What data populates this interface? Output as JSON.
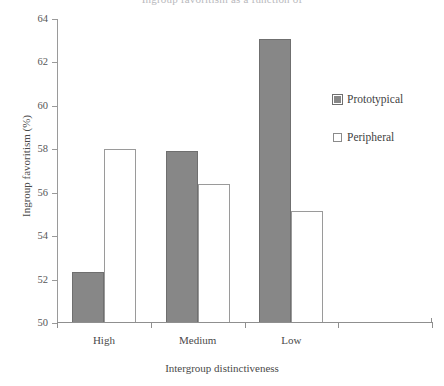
{
  "chart_data": {
    "type": "bar",
    "title": "Ingroup favoritism as a function of",
    "xlabel": "Intergroup distinctiveness",
    "ylabel": "Ingroup favoritism (%)",
    "categories": [
      "High",
      "Medium",
      "Low",
      ""
    ],
    "ylim": [
      50,
      64
    ],
    "ytick_step": 2,
    "yticks": [
      50,
      52,
      54,
      56,
      58,
      60,
      62,
      64
    ],
    "ytick_labels": [
      "50",
      "52",
      "54",
      "56",
      "58",
      "60",
      "62",
      "64"
    ],
    "grid": false,
    "legend_position": "right",
    "series": [
      {
        "name": "Prototypical",
        "color": "#878787",
        "values": [
          52.35,
          57.9,
          63.1,
          null
        ]
      },
      {
        "name": "Peripheral",
        "color": "#ffffff",
        "values": [
          58.0,
          56.4,
          55.15,
          null
        ]
      }
    ]
  },
  "axes": {
    "y_label": "Ingroup favoritism (%)",
    "x_label": "Intergroup distinctiveness"
  },
  "legend": {
    "items": [
      {
        "label": "Prototypical",
        "swatch": "filled-gray-square-icon"
      },
      {
        "label": "Peripheral",
        "swatch": "open-white-square-icon"
      }
    ]
  }
}
